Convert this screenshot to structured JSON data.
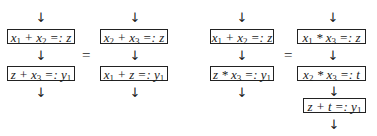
{
  "diagrams": [
    {
      "left": {
        "boxes": [
          {
            "html": "x<sub>1</sub> + x<sub>2</sub> =: z"
          },
          {
            "html": "z + x<sub>3</sub> =: y<sub>1</sub>"
          }
        ]
      },
      "equals": "=",
      "right": {
        "boxes": [
          {
            "html": "x<sub>2</sub> + x<sub>3</sub> =: z"
          },
          {
            "html": "x<sub>1</sub> + z =: y<sub>1</sub>"
          }
        ]
      }
    },
    {
      "left": {
        "boxes": [
          {
            "html": "x<sub>1</sub> + x<sub>2</sub> =: z"
          },
          {
            "html": "z * x<sub>3</sub> =: y<sub>1</sub>"
          }
        ]
      },
      "equals": "=",
      "right": {
        "boxes": [
          {
            "html": "x<sub>1</sub> * x<sub>3</sub> =: z"
          },
          {
            "html": "x<sub>2</sub> * x<sub>3</sub> =: t"
          },
          {
            "html": "z + t =: y<sub>1</sub>"
          }
        ]
      }
    }
  ],
  "arrow_glyph": "↓"
}
